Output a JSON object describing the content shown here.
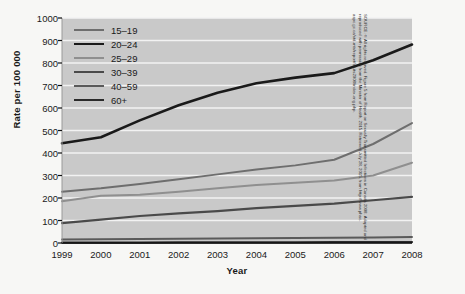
{
  "chart_data": {
    "type": "line",
    "title": "",
    "xlabel": "Year",
    "ylabel": "Rate per 100 000",
    "x": [
      1999,
      2000,
      2001,
      2002,
      2003,
      2004,
      2005,
      2006,
      2007,
      2008
    ],
    "xlim": [
      1999,
      2008
    ],
    "ylim": [
      0,
      1000
    ],
    "yticks": [
      0,
      100,
      200,
      300,
      400,
      500,
      600,
      700,
      800,
      900,
      1000
    ],
    "xticks": [
      "1999",
      "2000",
      "2001",
      "2002",
      "2003",
      "2004",
      "2005",
      "2006",
      "2007",
      "2008"
    ],
    "grid": true,
    "grid_axis": "y",
    "legend_position": "top-left-inside",
    "plot_background": "#c9c9c9",
    "gridline_color": "#f2f2f2",
    "series": [
      {
        "name": "15–19",
        "color": "#6e6e6e",
        "width": 2.0,
        "values": [
          228,
          243,
          262,
          283,
          305,
          327,
          345,
          370,
          440,
          533
        ]
      },
      {
        "name": "20–24",
        "color": "#1a1a1a",
        "width": 2.6,
        "values": [
          443,
          470,
          545,
          612,
          668,
          710,
          735,
          755,
          812,
          882
        ]
      },
      {
        "name": "25–29",
        "color": "#8f8f8f",
        "width": 2.0,
        "values": [
          186,
          210,
          215,
          228,
          243,
          258,
          268,
          278,
          300,
          357
        ]
      },
      {
        "name": "30–39",
        "color": "#4a4a4a",
        "width": 2.2,
        "values": [
          88,
          104,
          120,
          132,
          142,
          155,
          165,
          175,
          190,
          205
        ]
      },
      {
        "name": "40–59",
        "color": "#5a5a5a",
        "width": 2.0,
        "values": [
          16,
          17,
          18,
          19,
          20,
          21,
          22,
          23,
          25,
          27
        ]
      },
      {
        "name": "60+",
        "color": "#2a2a2a",
        "width": 2.2,
        "values": [
          2,
          2,
          2,
          3,
          3,
          3,
          3,
          4,
          4,
          4
        ]
      }
    ]
  },
  "source": {
    "text": "SOURCE: © All rights reserved. Figure 5 from Report on Sexually Transmitted Infections in Canada 2008. Adapted and reproduced with permission from the Minister of Health, 2015. Retrieved July 28, 2015, from http://www.phac-aspc.gc.ca/std-mts/report/sti-its2008/index-eng.php."
  }
}
